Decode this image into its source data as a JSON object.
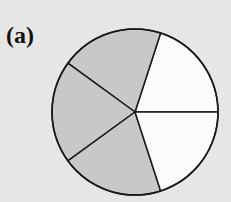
{
  "figure": {
    "label": "(a)",
    "total_parts": 5,
    "shaded_parts": 3,
    "fraction": "3/5"
  },
  "colors": {
    "background": "#e6e6e6",
    "shaded": "#c8c8c8",
    "unshaded": "#fbfbfb",
    "stroke": "#1a1a1a"
  },
  "geometry": {
    "center": [
      135,
      112
    ],
    "radius": 83,
    "sectors": [
      {
        "index": 0,
        "start_deg": 0,
        "end_deg": 72,
        "shaded": false
      },
      {
        "index": 1,
        "start_deg": 72,
        "end_deg": 144,
        "shaded": true
      },
      {
        "index": 2,
        "start_deg": 144,
        "end_deg": 216,
        "shaded": true
      },
      {
        "index": 3,
        "start_deg": 216,
        "end_deg": 288,
        "shaded": true
      },
      {
        "index": 4,
        "start_deg": 288,
        "end_deg": 360,
        "shaded": false
      }
    ]
  }
}
